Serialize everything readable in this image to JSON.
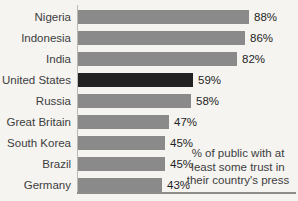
{
  "chart_data": {
    "type": "bar",
    "orientation": "horizontal",
    "title": "",
    "xlabel": "",
    "ylabel": "",
    "categories": [
      "Nigeria",
      "Indonesia",
      "India",
      "United States",
      "Russia",
      "Great Britain",
      "South Korea",
      "Brazil",
      "Germany"
    ],
    "values": [
      88,
      86,
      82,
      59,
      58,
      47,
      45,
      45,
      43
    ],
    "value_suffix": "%",
    "highlight_category": "United States",
    "annotation": "% of public with at\nleast some trust in\ntheir country's press",
    "xlim": [
      0,
      92
    ],
    "grid": false,
    "legend_position": "none",
    "colors": {
      "bar": "#8a8a8a",
      "highlight_bar": "#212121",
      "background": "#f5f4f1",
      "axis_line": "#b9b8b4",
      "baseline": "#8e8d89",
      "label_text": "#3d3d3d",
      "value_text": "#1f1f1f"
    }
  }
}
